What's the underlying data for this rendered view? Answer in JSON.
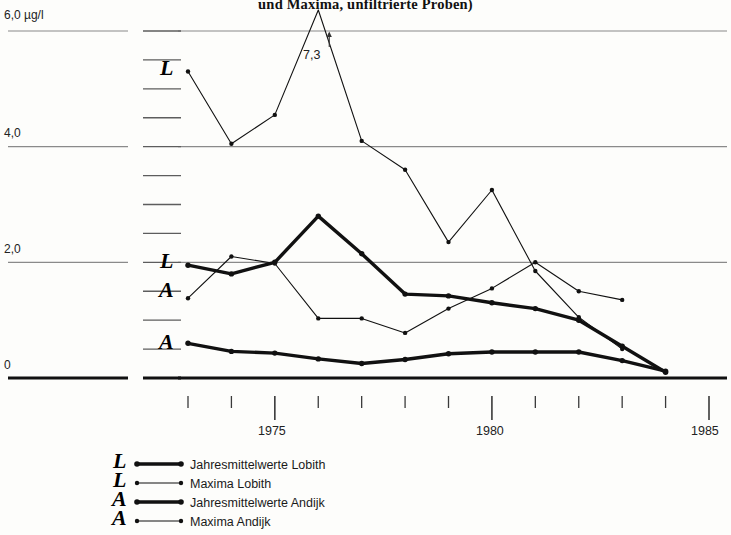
{
  "title": "und Maxima, unfiltrierte Proben)",
  "axes": {
    "y_unit_label": "6,0 µg/l",
    "y_ticks": [
      "6,0 µg/l",
      "4,0",
      "2,0",
      "0"
    ],
    "x_ticks": [
      "1975",
      "1980",
      "1985"
    ]
  },
  "annotation": {
    "peak_value": "7,3"
  },
  "hand_marks": {
    "axis_lobith_max": "L",
    "axis_lobith_mean": "L",
    "axis_andijk_max": "A",
    "axis_andijk_mean": "A",
    "legend_1": "L",
    "legend_2": "L",
    "legend_3": "A",
    "legend_4": "A"
  },
  "legend": {
    "items": [
      {
        "label": "Jahresmittelwerte Lobith",
        "style": "thick"
      },
      {
        "label": "Maxima Lobith",
        "style": "thin"
      },
      {
        "label": "Jahresmittelwerte Andijk",
        "style": "thick"
      },
      {
        "label": "Maxima Andijk",
        "style": "thin"
      }
    ]
  },
  "chart_data": {
    "type": "line",
    "title": "und Maxima, unfiltrierte Proben)",
    "xlabel": "",
    "ylabel": "µg/l",
    "xlim": [
      1973,
      1985
    ],
    "ylim": [
      0,
      6.0
    ],
    "ytick_values": [
      0,
      2.0,
      4.0,
      6.0
    ],
    "xtick_values": [
      1973,
      1974,
      1975,
      1976,
      1977,
      1978,
      1979,
      1980,
      1981,
      1982,
      1983,
      1984,
      1985
    ],
    "xtick_labels": [
      "",
      "",
      "1975",
      "",
      "",
      "",
      "",
      "1980",
      "",
      "",
      "",
      "",
      "1985"
    ],
    "grid": "horizontal",
    "legend_position": "below",
    "annotations": [
      {
        "text": "7,3",
        "x": 1976,
        "y": 6.0,
        "note": "off-scale peak of Maxima Lobith"
      }
    ],
    "x": [
      1973,
      1974,
      1975,
      1976,
      1977,
      1978,
      1979,
      1980,
      1981,
      1982,
      1983,
      1984
    ],
    "series": [
      {
        "name": "Jahresmittelwerte Lobith",
        "style": "thick",
        "values": [
          1.95,
          1.8,
          2.0,
          2.8,
          2.15,
          1.45,
          1.42,
          1.3,
          1.2,
          1.0,
          0.55,
          0.1
        ]
      },
      {
        "name": "Maxima Lobith",
        "style": "thin",
        "values": [
          5.3,
          4.05,
          4.55,
          7.3,
          4.1,
          3.6,
          2.35,
          3.25,
          1.85,
          1.05,
          0.5,
          null
        ]
      },
      {
        "name": "Jahresmittelwerte Andijk",
        "style": "thick",
        "values": [
          0.6,
          0.46,
          0.43,
          0.33,
          0.25,
          0.32,
          0.42,
          0.45,
          0.45,
          0.45,
          0.3,
          0.12
        ]
      },
      {
        "name": "Maxima Andijk",
        "style": "thin",
        "values": [
          1.38,
          2.1,
          1.98,
          1.03,
          1.03,
          0.78,
          1.2,
          1.55,
          2.0,
          1.5,
          1.35,
          null
        ]
      }
    ]
  }
}
